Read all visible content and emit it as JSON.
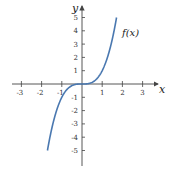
{
  "chart_data": {
    "type": "line",
    "title": "",
    "xlabel": "x",
    "ylabel": "y",
    "xlim": [
      -3.5,
      3.7
    ],
    "ylim": [
      -6,
      6
    ],
    "grid": false,
    "x_ticks": [
      -3,
      -2,
      -1,
      1,
      2,
      3
    ],
    "y_ticks": [
      -5,
      -4,
      -3,
      -2,
      -1,
      1,
      2,
      3,
      4,
      5
    ],
    "series": [
      {
        "name": "f(x)",
        "function": "x^3",
        "color": "#4a78b0",
        "x": [
          -1.71,
          -1.5,
          -1.25,
          -1,
          -0.75,
          -0.5,
          -0.25,
          0,
          0.25,
          0.5,
          0.75,
          1,
          1.25,
          1.5,
          1.71
        ],
        "y": [
          -5,
          -3.375,
          -1.953,
          -1,
          -0.422,
          -0.125,
          -0.016,
          0,
          0.016,
          0.125,
          0.422,
          1,
          1.953,
          3.375,
          5
        ]
      }
    ],
    "annotations": [
      {
        "text": "f(x)",
        "x": 2.0,
        "y": 3.8
      }
    ]
  },
  "labels": {
    "x_axis": "x",
    "y_axis": "y",
    "curve": "f(x)",
    "x_ticks": [
      "-3",
      "-2",
      "-1",
      "1",
      "2",
      "3"
    ],
    "y_ticks": [
      "5",
      "4",
      "3",
      "2",
      "1",
      "-1",
      "-2",
      "-3",
      "-4",
      "-5"
    ]
  }
}
